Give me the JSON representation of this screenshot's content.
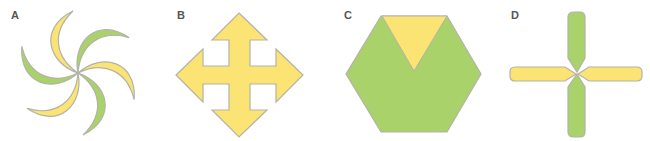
{
  "figures": [
    {
      "label": "A",
      "shape": "pinwheel of six crescent blades, alternating yellow and green"
    },
    {
      "label": "B",
      "shape": "four-way arrow cross (yellow)"
    },
    {
      "label": "C",
      "shape": "green hexagon with yellow downward triangle at top"
    },
    {
      "label": "D",
      "shape": "cross of four rounded bars: green vertical, yellow horizontal"
    }
  ],
  "colors": {
    "yellow": "#fbe374",
    "green": "#a9d26a",
    "outline": "#b3b3a8",
    "label": "#555555"
  }
}
